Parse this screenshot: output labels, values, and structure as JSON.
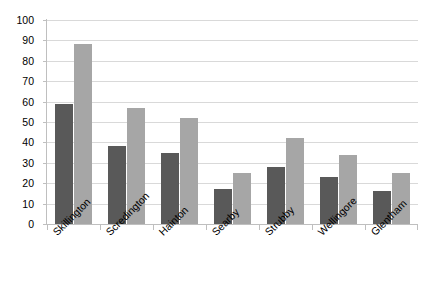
{
  "chart_data": {
    "type": "bar",
    "title": "",
    "subtitle": "",
    "xlabel": "",
    "ylabel": "",
    "ylim": [
      0,
      100
    ],
    "ytick_step": 10,
    "yticks": [
      100,
      90,
      80,
      70,
      60,
      50,
      40,
      30,
      20,
      10,
      0
    ],
    "grid": true,
    "grid_axis": "y",
    "legend": false,
    "legend_position": "none",
    "categories": [
      "Skillington",
      "Scredington",
      "Hainton",
      "Searby",
      "Strubby",
      "Wellingore",
      "Glentham"
    ],
    "series": [
      {
        "name": "Series 1",
        "color": "#595959",
        "values": [
          59,
          38,
          35,
          17,
          28,
          23,
          16
        ]
      },
      {
        "name": "Series 2",
        "color": "#a6a6a6",
        "values": [
          88,
          57,
          52,
          25,
          42,
          34,
          25
        ]
      }
    ]
  },
  "style": {
    "background": "#ffffff",
    "grid_color": "#d9d9d9",
    "axis_color": "#bfbfbf",
    "text_color": "#000000",
    "label_rotation_degrees": -45
  }
}
